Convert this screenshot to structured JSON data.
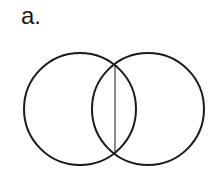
{
  "figure": {
    "label": "a.",
    "shapes": [
      {
        "type": "circle",
        "cx": 80,
        "cy": 109,
        "r": 56,
        "stroke": "#1a1a1a",
        "stroke_width": 2
      },
      {
        "type": "circle",
        "cx": 148,
        "cy": 109,
        "r": 56,
        "stroke": "#1a1a1a",
        "stroke_width": 2
      },
      {
        "type": "line",
        "x1": 115,
        "y1": 65,
        "x2": 115,
        "y2": 153,
        "stroke": "#1a1a1a",
        "stroke_width": 1
      }
    ]
  }
}
